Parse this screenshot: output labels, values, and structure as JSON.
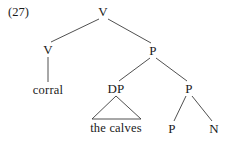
{
  "figure": {
    "example_number": "(27)",
    "type": "syntax-tree",
    "width": 235,
    "height": 144,
    "background_color": "#ffffff",
    "line_color": "#3c3c3c",
    "text_color": "#1a1a1a"
  },
  "nodes": [
    {
      "id": "v-root",
      "label": "V",
      "x": 103,
      "y": 11,
      "kind": "nonterminal"
    },
    {
      "id": "v-left",
      "label": "V",
      "x": 48,
      "y": 49,
      "kind": "nonterminal"
    },
    {
      "id": "p-upper",
      "label": "P",
      "x": 153,
      "y": 50,
      "kind": "nonterminal"
    },
    {
      "id": "corral",
      "label": "corral",
      "x": 48,
      "y": 90,
      "kind": "terminal"
    },
    {
      "id": "dp",
      "label": "DP",
      "x": 116,
      "y": 88,
      "kind": "nonterminal"
    },
    {
      "id": "p-mid",
      "label": "P",
      "x": 189,
      "y": 88,
      "kind": "nonterminal"
    },
    {
      "id": "calves",
      "label": "the calves",
      "x": 116,
      "y": 128,
      "kind": "terminal"
    },
    {
      "id": "p-leaf",
      "label": "P",
      "x": 172,
      "y": 128,
      "kind": "nonterminal"
    },
    {
      "id": "n-leaf",
      "label": "N",
      "x": 214,
      "y": 128,
      "kind": "nonterminal"
    }
  ],
  "edges": [
    {
      "from": "v-root",
      "to": "v-left",
      "x1": 99,
      "y1": 19,
      "x2": 51,
      "y2": 42
    },
    {
      "from": "v-root",
      "to": "p-upper",
      "x1": 108,
      "y1": 19,
      "x2": 151,
      "y2": 43
    },
    {
      "from": "v-left",
      "to": "corral",
      "x1": 48,
      "y1": 57,
      "x2": 48,
      "y2": 82
    },
    {
      "from": "p-upper",
      "to": "dp",
      "x1": 150,
      "y1": 58,
      "x2": 119,
      "y2": 81
    },
    {
      "from": "p-upper",
      "to": "p-mid",
      "x1": 156,
      "y1": 58,
      "x2": 187,
      "y2": 81
    },
    {
      "from": "p-mid",
      "to": "p-leaf",
      "x1": 186,
      "y1": 96,
      "x2": 174,
      "y2": 121
    },
    {
      "from": "p-mid",
      "to": "n-leaf",
      "x1": 192,
      "y1": 96,
      "x2": 212,
      "y2": 121
    }
  ],
  "triangles": [
    {
      "parent": "dp",
      "child": "calves",
      "apex_x": 116,
      "apex_y": 96,
      "left_x": 92,
      "right_x": 141,
      "base_y": 119
    }
  ]
}
